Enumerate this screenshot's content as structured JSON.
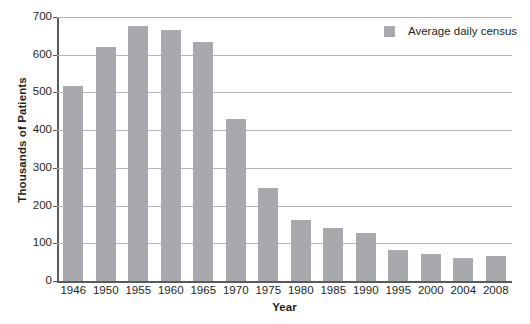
{
  "chart_data": {
    "type": "bar",
    "title": "",
    "xlabel": "Year",
    "ylabel": "Thousands of Patients",
    "categories": [
      "1946",
      "1950",
      "1955",
      "1960",
      "1965",
      "1970",
      "1975",
      "1980",
      "1985",
      "1990",
      "1995",
      "2000",
      "2004",
      "2008"
    ],
    "values": [
      518,
      620,
      677,
      665,
      633,
      430,
      247,
      163,
      141,
      128,
      83,
      72,
      62,
      67
    ],
    "series": [
      {
        "name": "Average daily census",
        "values": [
          518,
          620,
          677,
          665,
          633,
          430,
          247,
          163,
          141,
          128,
          83,
          72,
          62,
          67
        ],
        "color": "#a7a9ac"
      }
    ],
    "ylim": [
      0,
      700
    ],
    "yticks": [
      0,
      100,
      200,
      300,
      400,
      500,
      600,
      700
    ],
    "ytick_labels": [
      "0",
      "100",
      "200",
      "300",
      "400",
      "500",
      "600",
      "700"
    ],
    "grid": true,
    "legend_position": "top-right"
  },
  "legend": {
    "entries": [
      {
        "label": "Average daily census",
        "color": "#a7a9ac"
      }
    ]
  },
  "axes": {
    "y_title": "Thousands of Patients",
    "x_title": "Year"
  },
  "colors": {
    "bar": "#a7a9ac",
    "gridline": "#b5b5b5",
    "axis": "#58595b",
    "text": "#231f20",
    "background": "#ffffff"
  }
}
